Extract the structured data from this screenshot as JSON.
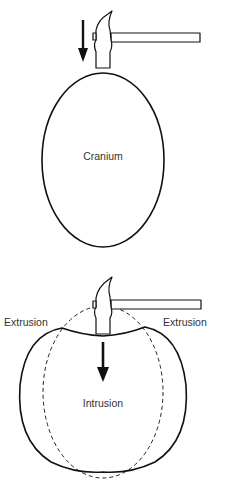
{
  "top_figure": {
    "label": "Cranium",
    "elements": [
      "hammer-icon",
      "down-arrow-icon",
      "cranium-outline"
    ]
  },
  "bottom_figure": {
    "left_label": "Extrusion",
    "right_label": "Extrusion",
    "center_label": "Intrusion",
    "elements": [
      "hammer-icon",
      "down-arrow-icon",
      "original-outline-dashed",
      "deformed-outline"
    ]
  },
  "colors": {
    "stroke": "#111111",
    "text": "#333333",
    "background": "#ffffff"
  }
}
